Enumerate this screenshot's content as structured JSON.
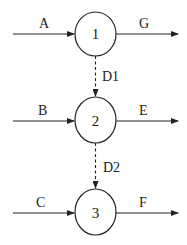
{
  "diagram": {
    "nodes": [
      {
        "id": "1",
        "label": "1",
        "cx": 95.5,
        "cy": 34,
        "rx": 20.5,
        "ry": 22
      },
      {
        "id": "2",
        "label": "2",
        "cx": 95.5,
        "cy": 120,
        "rx": 20.5,
        "ry": 23
      },
      {
        "id": "3",
        "label": "3",
        "cx": 95.5,
        "cy": 212,
        "rx": 20.5,
        "ry": 23
      }
    ],
    "inputs": [
      {
        "label": "A",
        "to": "1"
      },
      {
        "label": "B",
        "to": "2"
      },
      {
        "label": "C",
        "to": "3"
      }
    ],
    "outputs": [
      {
        "label": "G",
        "from": "1"
      },
      {
        "label": "E",
        "from": "2"
      },
      {
        "label": "F",
        "from": "3"
      }
    ],
    "links": [
      {
        "label": "D1",
        "from": "1",
        "to": "2",
        "style": "dashed"
      },
      {
        "label": "D2",
        "from": "2",
        "to": "3",
        "style": "dashed"
      }
    ]
  }
}
